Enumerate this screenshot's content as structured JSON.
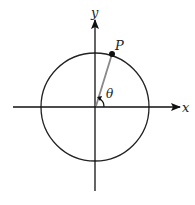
{
  "diagram": {
    "labels": {
      "x_axis": "x",
      "y_axis": "y",
      "point": "P",
      "angle": "θ"
    },
    "colors": {
      "axis": "#111111",
      "circle": "#222222",
      "radius": "#888888",
      "point": "#111111"
    }
  }
}
